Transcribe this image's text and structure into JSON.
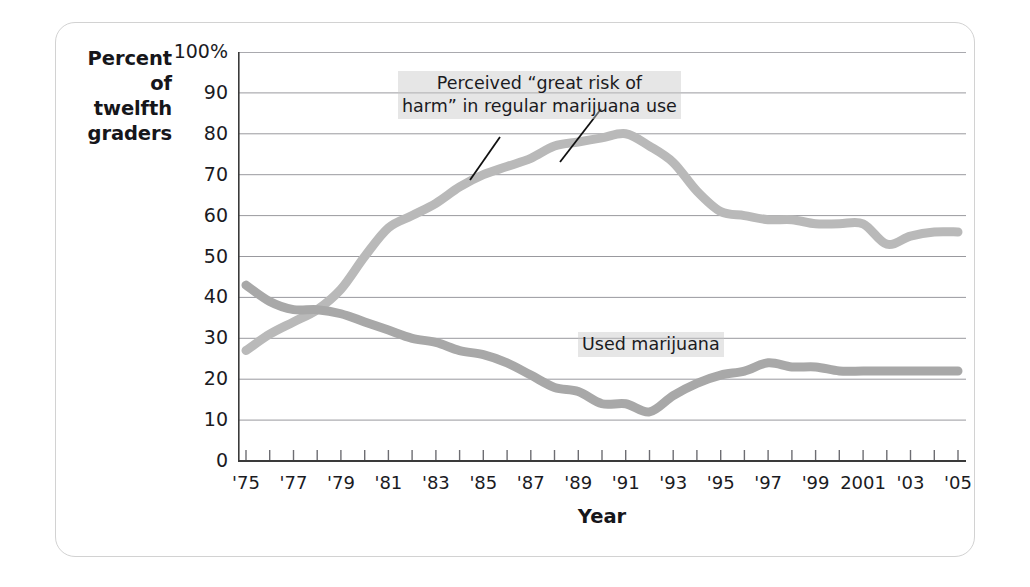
{
  "figure": {
    "y_axis_label": "Percent\nof\ntwelfth\ngraders",
    "x_axis_title": "Year"
  },
  "annotations": {
    "risk_line_1": "Perceived “great risk of",
    "risk_line_2": "harm” in regular marijuana use",
    "use_label": "Used marijuana"
  },
  "colors": {
    "risk_line": "#b9b9b9",
    "use_line": "#a8a8a8",
    "grid": "#8d8d93",
    "axis": "#3a3a3a",
    "frame": "#d2d2d2",
    "text": "#1b1b1f"
  },
  "chart_data": {
    "type": "line",
    "title": "",
    "xlabel": "Year",
    "ylabel": "Percent of twelfth graders",
    "xlim": [
      1975,
      2005
    ],
    "ylim": [
      0,
      100
    ],
    "grid": true,
    "legend": "annotations-inline",
    "ytick_labels": [
      "0",
      "10",
      "20",
      "30",
      "40",
      "50",
      "60",
      "70",
      "80",
      "90",
      "100%"
    ],
    "ytick_values": [
      0,
      10,
      20,
      30,
      40,
      50,
      60,
      70,
      80,
      90,
      100
    ],
    "xtick_labels": [
      "'75",
      "'77",
      "'79",
      "'81",
      "'83",
      "'85",
      "'87",
      "'89",
      "'91",
      "'93",
      "'95",
      "'97",
      "'99",
      "2001",
      "'03",
      "'05"
    ],
    "xtick_values": [
      1975,
      1977,
      1979,
      1981,
      1983,
      1985,
      1987,
      1989,
      1991,
      1993,
      1995,
      1997,
      1999,
      2001,
      2003,
      2005
    ],
    "x": [
      1975,
      1976,
      1977,
      1978,
      1979,
      1980,
      1981,
      1982,
      1983,
      1984,
      1985,
      1986,
      1987,
      1988,
      1989,
      1990,
      1991,
      1992,
      1993,
      1994,
      1995,
      1996,
      1997,
      1998,
      1999,
      2000,
      2001,
      2002,
      2003,
      2004,
      2005
    ],
    "series": [
      {
        "name": "Perceived “great risk of harm” in regular marijuana use",
        "color": "#b9b9b9",
        "values": [
          27,
          31,
          34,
          37,
          42,
          50,
          57,
          60,
          63,
          67,
          70,
          72,
          74,
          77,
          78,
          79,
          80,
          77,
          73,
          66,
          61,
          60,
          59,
          59,
          58,
          58,
          58,
          53,
          55,
          56,
          56
        ]
      },
      {
        "name": "Used marijuana",
        "color": "#a8a8a8",
        "values": [
          43,
          39,
          37,
          37,
          36,
          34,
          32,
          30,
          29,
          27,
          26,
          24,
          21,
          18,
          17,
          14,
          14,
          12,
          16,
          19,
          21,
          22,
          24,
          23,
          23,
          22,
          22,
          22,
          22,
          22,
          22
        ]
      }
    ]
  }
}
